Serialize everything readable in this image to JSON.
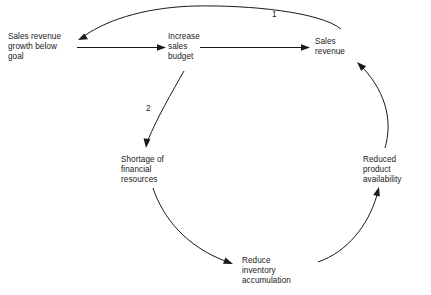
{
  "diagram": {
    "type": "causal-loop-diagram",
    "nodes": [
      {
        "id": "sales-revenue-growth-below-goal",
        "label": "Sales revenue\ngrowth below\ngoal",
        "x": 8,
        "y": 32
      },
      {
        "id": "increase-sales-budget",
        "label": "Increase\nsales\nbudget",
        "x": 168,
        "y": 32
      },
      {
        "id": "sales-revenue",
        "label": "Sales\nrevenue",
        "x": 315,
        "y": 37
      },
      {
        "id": "shortage-of-financial-resources",
        "label": "Shortage of\nfinancial\nresources",
        "x": 121,
        "y": 155
      },
      {
        "id": "reduced-product-availability",
        "label": "Reduced\nproduct\navailability",
        "x": 363,
        "y": 155
      },
      {
        "id": "reduce-inventory-accumulation",
        "label": "Reduce\ninventory\naccumulation",
        "x": 242,
        "y": 256
      }
    ],
    "loop_labels": [
      {
        "id": "loop-1",
        "text": "1",
        "x": 272,
        "y": 10
      },
      {
        "id": "loop-2",
        "text": "2",
        "x": 146,
        "y": 104
      }
    ],
    "edges": [
      {
        "id": "edge-growth-to-budget",
        "from": "sales-revenue-growth-below-goal",
        "to": "increase-sales-budget",
        "shape": "straight"
      },
      {
        "id": "edge-budget-to-revenue",
        "from": "increase-sales-budget",
        "to": "sales-revenue",
        "shape": "straight"
      },
      {
        "id": "edge-revenue-to-growth",
        "from": "sales-revenue",
        "to": "sales-revenue-growth-below-goal",
        "shape": "arc-over-top",
        "label": "1"
      },
      {
        "id": "edge-budget-to-shortage",
        "from": "increase-sales-budget",
        "to": "shortage-of-financial-resources",
        "shape": "arc-down-left",
        "label": "2"
      },
      {
        "id": "edge-shortage-to-reduce-inventory",
        "from": "shortage-of-financial-resources",
        "to": "reduce-inventory-accumulation",
        "shape": "arc-down-right"
      },
      {
        "id": "edge-reduce-inventory-to-reduced-availability",
        "from": "reduce-inventory-accumulation",
        "to": "reduced-product-availability",
        "shape": "arc-up-right"
      },
      {
        "id": "edge-reduced-availability-to-revenue",
        "from": "reduced-product-availability",
        "to": "sales-revenue",
        "shape": "arc-up"
      }
    ],
    "colors": {
      "stroke": "#1a1a1a",
      "text": "#1a1a1a",
      "background": "#ffffff"
    }
  }
}
